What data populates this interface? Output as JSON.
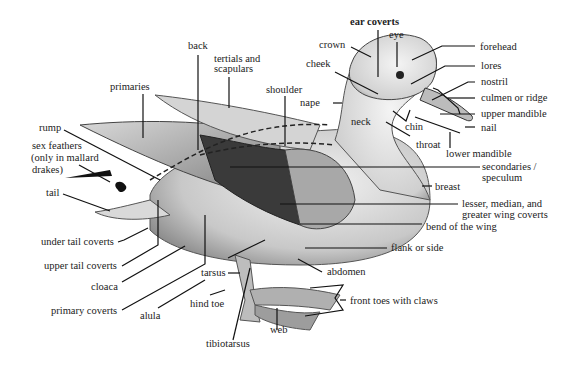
{
  "diagram": {
    "labels": {
      "ear_coverts": "ear coverts",
      "eye": "eye",
      "crown": "crown",
      "forehead": "forehead",
      "cheek": "cheek",
      "lores": "lores",
      "nostril": "nostril",
      "culmen": "culmen or ridge",
      "upper_mandible": "upper mandible",
      "nail": "nail",
      "nape": "nape",
      "neck": "neck",
      "chin": "chin",
      "throat": "throat",
      "lower_mandible": "lower  mandible",
      "back": "back",
      "tertials_1": "tertials and",
      "tertials_2": "scapulars",
      "shoulder": "shoulder",
      "primaries": "primaries",
      "rump": "rump",
      "sex_feathers_1": "sex feathers",
      "sex_feathers_2": "(only in mallard",
      "sex_feathers_3": "drakes)",
      "tail": "tail",
      "secondaries_1": "secondaries /",
      "secondaries_2": "speculum",
      "breast": "breast",
      "wing_coverts_1": "lesser, median, and",
      "wing_coverts_2": "greater wing coverts",
      "bend_of_wing": "bend of the wing",
      "flank": "flank or side",
      "abdomen": "abdomen",
      "front_toes": "front toes with claws",
      "under_tail_coverts": "under tail coverts",
      "upper_tail_coverts": "upper tail coverts",
      "cloaca": "cloaca",
      "primary_coverts": "primary coverts",
      "alula": "alula",
      "tarsus": "tarsus",
      "hind_toe": "hind toe",
      "web": "web",
      "tibiotarsus": "tibiotarsus"
    }
  }
}
